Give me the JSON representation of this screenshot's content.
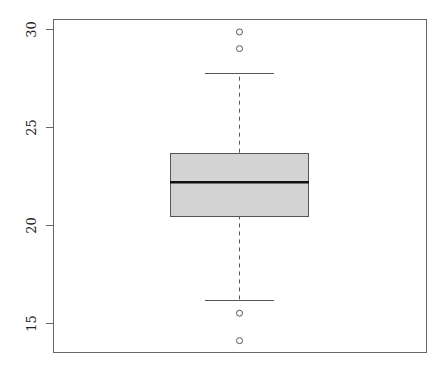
{
  "chart_data": {
    "type": "boxplot",
    "title": "",
    "xlabel": "",
    "ylabel": "",
    "ylim": [
      13.6,
      30.5
    ],
    "yticks": [
      15,
      20,
      25,
      30
    ],
    "ytick_labels": [
      "15",
      "20",
      "25",
      "30"
    ],
    "grid": false,
    "legend": null,
    "series": [
      {
        "name": "",
        "whisker_low": 16.17,
        "q1": 20.49,
        "median": 22.18,
        "q3": 23.69,
        "whisker_high": 27.74,
        "outliers": [
          14.1,
          15.5,
          29.0,
          29.85
        ]
      }
    ],
    "style": {
      "box_fill": "#d3d3d3",
      "box_border": "#555555",
      "median_color": "#111111",
      "whisker_color": "#555555",
      "whisker_dash": "4,4",
      "axis_color": "#666666"
    }
  },
  "layout": {
    "plot_left": 53,
    "plot_right": 426,
    "plot_top": 19,
    "plot_bottom": 352,
    "y_at_30": 29,
    "px_per_unit": 19.6,
    "box_left": 170,
    "box_right": 308,
    "cap_left": 205,
    "cap_right": 274,
    "center_x": 239
  }
}
